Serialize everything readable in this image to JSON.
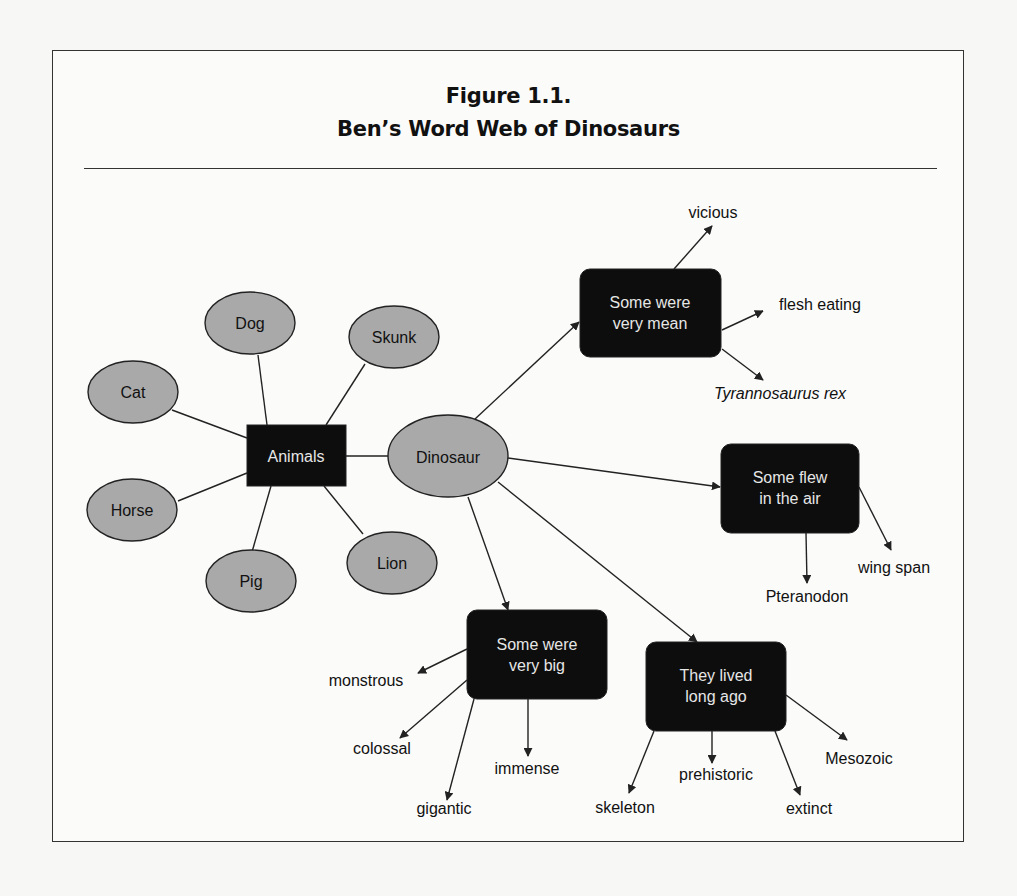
{
  "figure": {
    "number": "Figure 1.1.",
    "title": "Ben’s Word Web of Dinosaurs"
  },
  "colors": {
    "ellipse_fill": "#a9a9a9",
    "box_fill": "#0d0d0d",
    "box_text": "#e6e6e6",
    "line": "#222222"
  },
  "animals_web": {
    "center": "Animals",
    "items": [
      "Dog",
      "Skunk",
      "Cat",
      "Horse",
      "Pig",
      "Lion"
    ]
  },
  "dinosaur_web": {
    "center": "Dinosaur",
    "branches": [
      {
        "label_line1": "Some were",
        "label_line2": "very mean",
        "words": [
          "vicious",
          "flesh eating",
          "Tyrannosaurus rex"
        ]
      },
      {
        "label_line1": "Some flew",
        "label_line2": "in the air",
        "words": [
          "wing span",
          "Pteranodon"
        ]
      },
      {
        "label_line1": "Some were",
        "label_line2": "very big",
        "words": [
          "monstrous",
          "colossal",
          "immense",
          "gigantic"
        ]
      },
      {
        "label_line1": "They lived",
        "label_line2": "long ago",
        "words": [
          "skeleton",
          "prehistoric",
          "extinct",
          "Mesozoic"
        ]
      }
    ]
  }
}
